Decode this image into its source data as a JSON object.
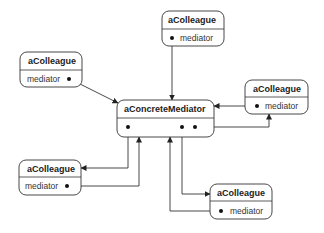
{
  "diagram": {
    "mediator": {
      "title": "aConcreteMediator"
    },
    "colleagues": [
      {
        "id": "top",
        "title": "aColleague",
        "attribute": "mediator"
      },
      {
        "id": "left-top",
        "title": "aColleague",
        "attribute": "mediator"
      },
      {
        "id": "right",
        "title": "aColleague",
        "attribute": "mediator"
      },
      {
        "id": "bottom-left",
        "title": "aColleague",
        "attribute": "mediator"
      },
      {
        "id": "bottom-right",
        "title": "aColleague",
        "attribute": "mediator"
      }
    ],
    "colors": {
      "stroke": "#333333",
      "text": "#222222",
      "background": "#ffffff"
    }
  }
}
